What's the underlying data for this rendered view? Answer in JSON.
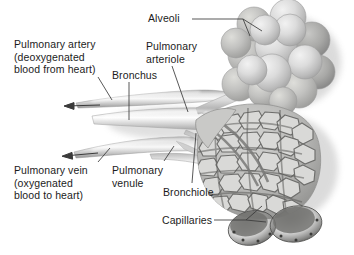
{
  "figure": {
    "background_color": "#ffffff",
    "text_color": "#1c1c1c",
    "line_color": "#333333",
    "style": "grayscale anatomical illustration"
  },
  "labels": {
    "alveoli": "Alveoli",
    "pulmonary_artery": "Pulmonary artery\n(deoxygenated\nblood from heart)",
    "pulmonary_arteriole": "Pulmonary\narteriole",
    "bronchus": "Bronchus",
    "pulmonary_vein": "Pulmonary vein\n(oxygenated\nblood to heart)",
    "pulmonary_venule": "Pulmonary\nvenule",
    "bronchiole": "Bronchiole",
    "capillaries": "Capillaries"
  },
  "structures": [
    {
      "name": "alveoli-cluster",
      "description": "grape-like bunch of overlapping spherical alveoli, upper right"
    },
    {
      "name": "capillary-network",
      "description": "dense irregular mesh of capillaries covering alveolar sac, lower right"
    },
    {
      "name": "cut-open-alveoli",
      "description": "two dark cut-open alveolar sacs at bottom right"
    },
    {
      "name": "bronchus-tube",
      "description": "large central airway tube running left to right"
    },
    {
      "name": "bronchiole-tube",
      "description": "narrower airway branching toward alveolar sac"
    },
    {
      "name": "pulmonary-artery-vessel",
      "description": "upper vessel carrying deoxygenated blood, arrow points left"
    },
    {
      "name": "pulmonary-vein-vessel",
      "description": "lower vessel carrying oxygenated blood, arrow points left"
    }
  ],
  "flow_arrows": [
    {
      "name": "artery-flow-arrow",
      "direction": "left",
      "meaning": "deoxygenated blood from heart"
    },
    {
      "name": "vein-flow-arrow",
      "direction": "left",
      "meaning": "oxygenated blood to heart"
    }
  ]
}
